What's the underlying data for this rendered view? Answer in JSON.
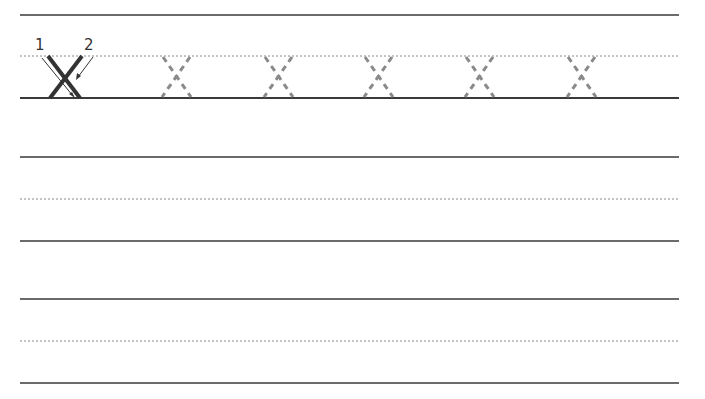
{
  "worksheet": {
    "letter": "X",
    "stroke_labels": [
      "1",
      "2"
    ],
    "colors": {
      "solid_line": "#3a3a3a",
      "dotted_line": "#888888",
      "example_letter": "#333333",
      "traced_letter": "#8a8a8a"
    },
    "rows": [
      {
        "top": 15,
        "mid": 56,
        "base": 98,
        "example": true,
        "trace_count": 5
      },
      {
        "top": 157,
        "mid": 199,
        "base": 241,
        "example": false,
        "trace_count": 0
      },
      {
        "top": 299,
        "mid": 341,
        "base": 383,
        "example": false,
        "trace_count": 0
      }
    ],
    "trace_centers_x": [
      176,
      278,
      378,
      479,
      581
    ]
  }
}
